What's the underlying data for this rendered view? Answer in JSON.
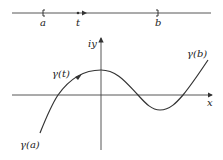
{
  "parameter_line": {
    "labels": {
      "a": "a",
      "t": "t",
      "b": "b"
    }
  },
  "plane": {
    "x_axis_label": "x",
    "y_axis_label": "iy",
    "curve_labels": {
      "start": "γ(a)",
      "moving": "γ(t)",
      "end": "γ(b)"
    }
  },
  "colors": {
    "ink": "#333333",
    "background": "#ffffff"
  }
}
